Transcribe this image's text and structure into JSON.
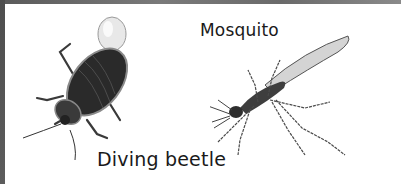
{
  "labels": {
    "beetle": "Diving beetle",
    "mosquito": "Mosquito"
  },
  "illustrations": [
    {
      "name": "diving-beetle",
      "description": "Dark shelled water beetle carrying an air bubble"
    },
    {
      "name": "mosquito",
      "description": "Long-legged mosquito illustration"
    }
  ],
  "colors": {
    "frame": "#5e5e5e",
    "background": "#ffffff",
    "text": "#1a1a1a"
  }
}
